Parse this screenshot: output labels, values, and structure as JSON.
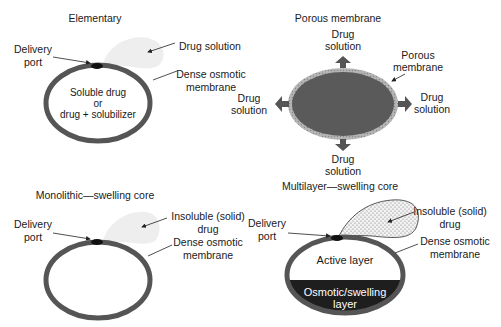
{
  "panels": {
    "elementary": {
      "title": "Elementary",
      "labels": {
        "delivery_port": [
          "Delivery",
          "port"
        ],
        "drug_solution": "Drug solution",
        "membrane": [
          "Dense osmotic",
          "membrane"
        ],
        "core": [
          "Soluble drug",
          "or",
          "drug + solubilizer"
        ]
      }
    },
    "porous": {
      "title": "Porous membrane",
      "labels": {
        "top": [
          "Drug",
          "solution"
        ],
        "left": [
          "Drug",
          "solution"
        ],
        "right": [
          "Drug",
          "solution"
        ],
        "bottom": [
          "Drug",
          "solution"
        ],
        "membrane": [
          "Porous",
          "membrane"
        ]
      }
    },
    "monolithic": {
      "title": "Monolithic—swelling core",
      "labels": {
        "delivery_port": [
          "Delivery",
          "port"
        ],
        "drug": [
          "Insoluble (solid)",
          "drug"
        ],
        "membrane": [
          "Dense osmotic",
          "membrane"
        ]
      }
    },
    "multilayer": {
      "title": "Multilayer—swelling core",
      "labels": {
        "delivery_port": [
          "Delivery",
          "port"
        ],
        "drug": [
          "Insoluble (solid)",
          "drug"
        ],
        "membrane": [
          "Dense osmotic",
          "membrane"
        ],
        "active_layer": "Active layer",
        "osmotic_layer": [
          "Osmotic/swelling",
          "layer"
        ]
      }
    }
  },
  "colors": {
    "membrane": "#555555",
    "plume": "#eeeeee",
    "porous_core": "#5a5a5a",
    "porous_rim": "#a8a8a8",
    "osmotic_layer": "#1e1e1e",
    "arrow": "#555555"
  }
}
